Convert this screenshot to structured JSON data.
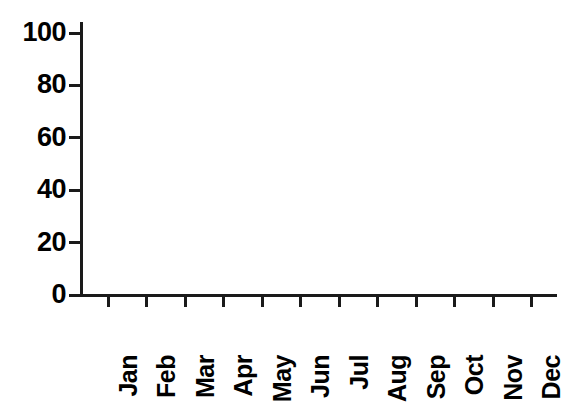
{
  "chart_data": {
    "type": "bar",
    "title": "",
    "xlabel": "",
    "ylabel": "",
    "categories": [
      "Jan",
      "Feb",
      "Mar",
      "Apr",
      "May",
      "Jun",
      "Jul",
      "Aug",
      "Sep",
      "Oct",
      "Nov",
      "Dec"
    ],
    "values": [
      0,
      0,
      0,
      0,
      0,
      0,
      0,
      0,
      0,
      0,
      0,
      0
    ],
    "ylim": [
      0,
      100
    ],
    "y_ticks": [
      0,
      20,
      40,
      60,
      80,
      100
    ],
    "y_tick_labels": [
      "0",
      "20",
      "40",
      "60",
      "80",
      "100"
    ],
    "grid": false,
    "legend": false
  },
  "axes": {
    "y_axis_name": "y-axis",
    "x_axis_name": "x-axis",
    "x_tick_labels_rotation": "90"
  },
  "colors": {
    "ink": "#1a1a1a",
    "background": "#ffffff"
  }
}
